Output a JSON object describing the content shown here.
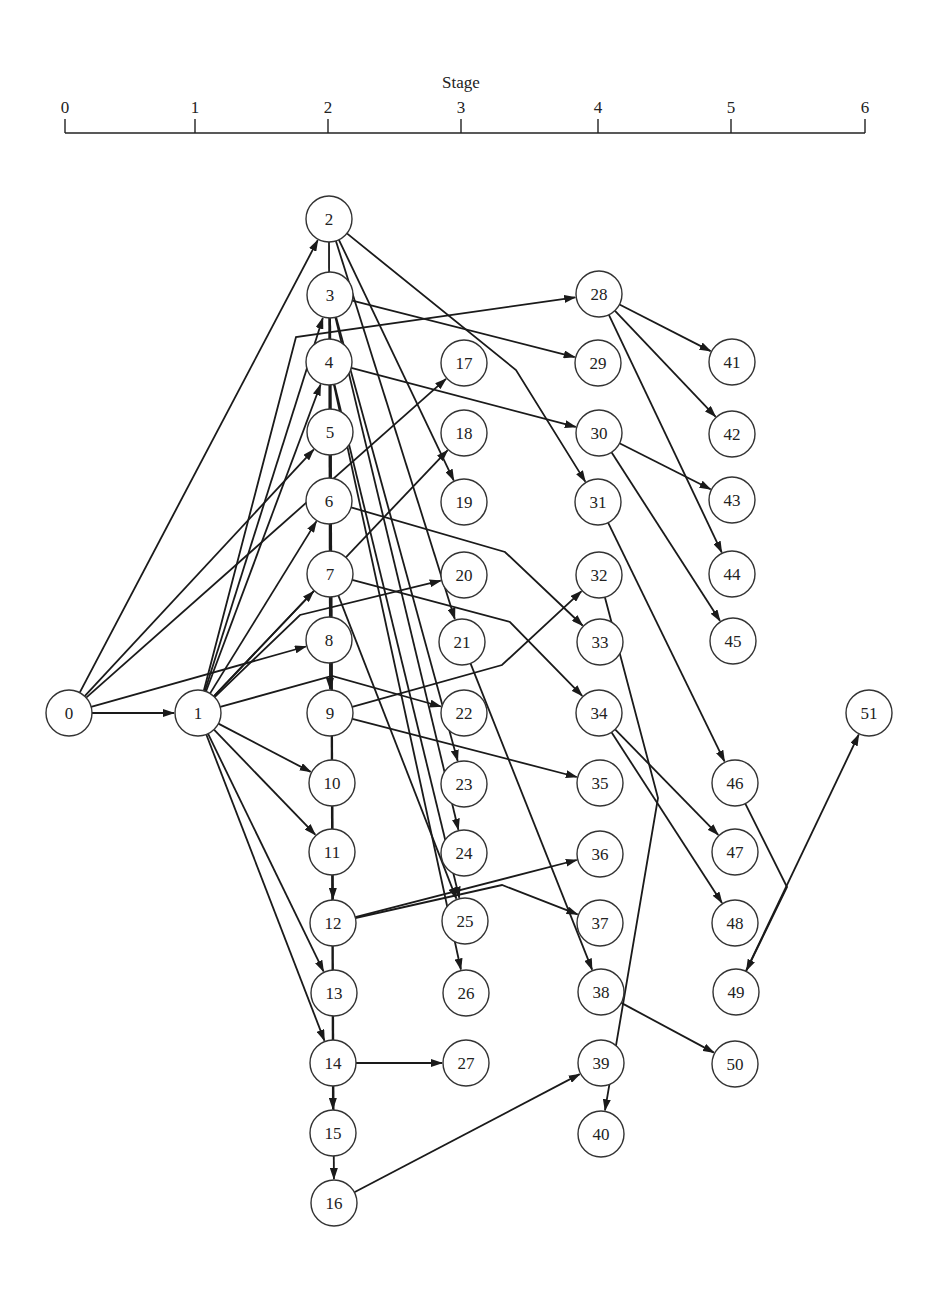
{
  "axis": {
    "title": "Stage",
    "x_start": 65,
    "x_end": 865,
    "y": 133,
    "ticks": [
      {
        "label": "0",
        "x": 65
      },
      {
        "label": "1",
        "x": 195
      },
      {
        "label": "2",
        "x": 328
      },
      {
        "label": "3",
        "x": 461
      },
      {
        "label": "4",
        "x": 598
      },
      {
        "label": "5",
        "x": 731
      },
      {
        "label": "6",
        "x": 865
      }
    ]
  },
  "node_radius": 23,
  "nodes": [
    {
      "id": "0",
      "x": 69,
      "y": 713
    },
    {
      "id": "1",
      "x": 198,
      "y": 713
    },
    {
      "id": "2",
      "x": 329,
      "y": 219
    },
    {
      "id": "3",
      "x": 330,
      "y": 295
    },
    {
      "id": "4",
      "x": 329,
      "y": 362
    },
    {
      "id": "5",
      "x": 330,
      "y": 432
    },
    {
      "id": "6",
      "x": 329,
      "y": 501
    },
    {
      "id": "7",
      "x": 330,
      "y": 574
    },
    {
      "id": "8",
      "x": 329,
      "y": 640
    },
    {
      "id": "9",
      "x": 330,
      "y": 713
    },
    {
      "id": "10",
      "x": 332,
      "y": 783
    },
    {
      "id": "11",
      "x": 332,
      "y": 852
    },
    {
      "id": "12",
      "x": 333,
      "y": 923
    },
    {
      "id": "13",
      "x": 334,
      "y": 993
    },
    {
      "id": "14",
      "x": 333,
      "y": 1063
    },
    {
      "id": "15",
      "x": 333,
      "y": 1133
    },
    {
      "id": "16",
      "x": 334,
      "y": 1203
    },
    {
      "id": "17",
      "x": 464,
      "y": 363
    },
    {
      "id": "18",
      "x": 464,
      "y": 433
    },
    {
      "id": "19",
      "x": 464,
      "y": 502
    },
    {
      "id": "20",
      "x": 464,
      "y": 575
    },
    {
      "id": "21",
      "x": 462,
      "y": 642
    },
    {
      "id": "22",
      "x": 464,
      "y": 713
    },
    {
      "id": "23",
      "x": 464,
      "y": 784
    },
    {
      "id": "24",
      "x": 464,
      "y": 853
    },
    {
      "id": "25",
      "x": 465,
      "y": 921
    },
    {
      "id": "26",
      "x": 466,
      "y": 993
    },
    {
      "id": "27",
      "x": 466,
      "y": 1063
    },
    {
      "id": "28",
      "x": 599,
      "y": 294
    },
    {
      "id": "29",
      "x": 598,
      "y": 363
    },
    {
      "id": "30",
      "x": 599,
      "y": 433
    },
    {
      "id": "31",
      "x": 598,
      "y": 502
    },
    {
      "id": "32",
      "x": 599,
      "y": 575
    },
    {
      "id": "33",
      "x": 600,
      "y": 642
    },
    {
      "id": "34",
      "x": 599,
      "y": 713
    },
    {
      "id": "35",
      "x": 600,
      "y": 783
    },
    {
      "id": "36",
      "x": 600,
      "y": 854
    },
    {
      "id": "37",
      "x": 600,
      "y": 923
    },
    {
      "id": "38",
      "x": 601,
      "y": 992
    },
    {
      "id": "39",
      "x": 601,
      "y": 1063
    },
    {
      "id": "40",
      "x": 601,
      "y": 1134
    },
    {
      "id": "41",
      "x": 732,
      "y": 362
    },
    {
      "id": "42",
      "x": 732,
      "y": 434
    },
    {
      "id": "43",
      "x": 732,
      "y": 500
    },
    {
      "id": "44",
      "x": 732,
      "y": 574
    },
    {
      "id": "45",
      "x": 733,
      "y": 641
    },
    {
      "id": "46",
      "x": 735,
      "y": 783
    },
    {
      "id": "47",
      "x": 735,
      "y": 852
    },
    {
      "id": "48",
      "x": 735,
      "y": 923
    },
    {
      "id": "49",
      "x": 736,
      "y": 992
    },
    {
      "id": "50",
      "x": 735,
      "y": 1064
    },
    {
      "id": "51",
      "x": 869,
      "y": 713
    }
  ],
  "edges": [
    {
      "from": "0",
      "to": "1"
    },
    {
      "from": "0",
      "to": "2"
    },
    {
      "from": "0",
      "to": "5"
    },
    {
      "from": "0",
      "to": "8"
    },
    {
      "from": "0",
      "to": "17"
    },
    {
      "from": "1",
      "to": "3"
    },
    {
      "from": "1",
      "to": "4"
    },
    {
      "from": "1",
      "to": "6"
    },
    {
      "from": "1",
      "to": "7"
    },
    {
      "from": "1",
      "to": "10"
    },
    {
      "from": "1",
      "to": "11"
    },
    {
      "from": "1",
      "to": "13"
    },
    {
      "from": "1",
      "to": "14"
    },
    {
      "from": "1",
      "to": "18"
    },
    {
      "from": "1",
      "to": "20",
      "via": [
        [
          300,
          615
        ]
      ]
    },
    {
      "from": "1",
      "to": "22",
      "via": [
        [
          332,
          676
        ]
      ]
    },
    {
      "from": "1",
      "to": "28",
      "via": [
        [
          296,
          337
        ]
      ]
    },
    {
      "from": "2",
      "to": "9"
    },
    {
      "from": "2",
      "to": "19"
    },
    {
      "from": "2",
      "to": "21"
    },
    {
      "from": "2",
      "to": "31",
      "via": [
        [
          516,
          370
        ]
      ]
    },
    {
      "from": "3",
      "to": "12"
    },
    {
      "from": "3",
      "to": "15"
    },
    {
      "from": "3",
      "to": "16"
    },
    {
      "from": "3",
      "to": "23"
    },
    {
      "from": "3",
      "to": "24"
    },
    {
      "from": "3",
      "to": "29"
    },
    {
      "from": "4",
      "to": "25"
    },
    {
      "from": "4",
      "to": "26"
    },
    {
      "from": "4",
      "to": "30"
    },
    {
      "from": "6",
      "to": "33",
      "via": [
        [
          505,
          552
        ]
      ]
    },
    {
      "from": "7",
      "to": "25"
    },
    {
      "from": "7",
      "to": "34",
      "via": [
        [
          510,
          622
        ]
      ]
    },
    {
      "from": "9",
      "to": "32",
      "via": [
        [
          502,
          665
        ]
      ]
    },
    {
      "from": "9",
      "to": "35"
    },
    {
      "from": "12",
      "to": "36"
    },
    {
      "from": "12",
      "to": "37",
      "via": [
        [
          502,
          885
        ]
      ]
    },
    {
      "from": "14",
      "to": "27"
    },
    {
      "from": "16",
      "to": "39"
    },
    {
      "from": "21",
      "to": "38"
    },
    {
      "from": "28",
      "to": "41"
    },
    {
      "from": "28",
      "to": "42"
    },
    {
      "from": "28",
      "to": "44"
    },
    {
      "from": "30",
      "to": "43"
    },
    {
      "from": "30",
      "to": "45"
    },
    {
      "from": "31",
      "to": "46"
    },
    {
      "from": "32",
      "to": "40",
      "via": [
        [
          658,
          798
        ]
      ]
    },
    {
      "from": "34",
      "to": "47"
    },
    {
      "from": "34",
      "to": "48"
    },
    {
      "from": "38",
      "to": "50"
    },
    {
      "from": "46",
      "to": "49",
      "via": [
        [
          787,
          887
        ]
      ]
    },
    {
      "from": "49",
      "to": "51"
    }
  ]
}
